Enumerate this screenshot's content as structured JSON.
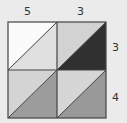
{
  "labels": {
    "top": [
      "5",
      "3"
    ],
    "side": [
      "3",
      "4"
    ]
  },
  "grid": {
    "rows": 2,
    "cols": 2,
    "cells": [
      {
        "row": 0,
        "col": 0,
        "upper_left_color": "#fbfbfb",
        "lower_right_color": "#e0e0e0"
      },
      {
        "row": 0,
        "col": 1,
        "upper_left_color": "#d2d2d2",
        "lower_right_color": "#303030"
      },
      {
        "row": 1,
        "col": 0,
        "upper_left_color": "#d4d4d4",
        "lower_right_color": "#9c9c9c"
      },
      {
        "row": 1,
        "col": 1,
        "upper_left_color": "#d6d6d6",
        "lower_right_color": "#999999"
      }
    ],
    "line_color": "#444444"
  }
}
